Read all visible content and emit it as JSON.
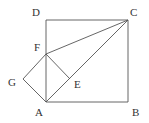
{
  "diagram": {
    "type": "geometry",
    "points": {
      "A": {
        "label": "A",
        "x": 46,
        "y": 102,
        "lx": 35,
        "ly": 116
      },
      "B": {
        "label": "B",
        "x": 128,
        "y": 102,
        "lx": 132,
        "ly": 116
      },
      "C": {
        "label": "C",
        "x": 128,
        "y": 20,
        "lx": 130,
        "ly": 16
      },
      "D": {
        "label": "D",
        "x": 46,
        "y": 20,
        "lx": 32,
        "ly": 16
      },
      "E": {
        "label": "E",
        "x": 70,
        "y": 79,
        "lx": 74,
        "ly": 88
      },
      "F": {
        "label": "F",
        "x": 46,
        "y": 54,
        "lx": 34,
        "ly": 51
      },
      "G": {
        "label": "G",
        "x": 23,
        "y": 79,
        "lx": 8,
        "ly": 86
      }
    },
    "segments": [
      [
        "A",
        "B"
      ],
      [
        "B",
        "C"
      ],
      [
        "C",
        "D"
      ],
      [
        "D",
        "A"
      ],
      [
        "A",
        "C"
      ],
      [
        "F",
        "C"
      ],
      [
        "F",
        "G"
      ],
      [
        "G",
        "A"
      ],
      [
        "F",
        "E"
      ]
    ]
  }
}
